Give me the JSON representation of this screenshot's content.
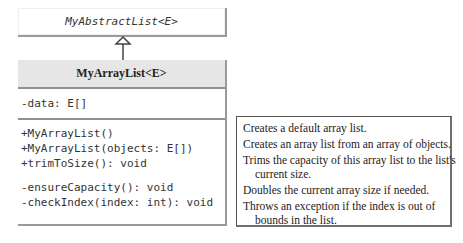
{
  "diagram": {
    "type": "uml-class-diagram",
    "parent_class": {
      "name": "MyAbstractList<E>",
      "abstract": true
    },
    "relationship": "inheritance",
    "class": {
      "name": "MyArrayList<E>",
      "attributes": [
        "-data: E[]"
      ],
      "methods": [
        "+MyArrayList()",
        "+MyArrayList(objects: E[])",
        "+trimToSize(): void",
        "-ensureCapacity(): void",
        "-checkIndex(index: int): void"
      ]
    },
    "descriptions": [
      {
        "line1": "Creates a default array list.",
        "line2": ""
      },
      {
        "line1": "Creates an array list from an array of objects.",
        "line2": ""
      },
      {
        "line1": "Trims the capacity of this array list to the list's",
        "line2": "current size."
      },
      {
        "line1": "Doubles the current array size if needed.",
        "line2": ""
      },
      {
        "line1": "Throws an exception if the index is out of",
        "line2": "bounds in the list."
      }
    ]
  },
  "colors": {
    "header_fill": "#e6e6e6",
    "border": "#8f8f8f",
    "text": "#333333"
  }
}
